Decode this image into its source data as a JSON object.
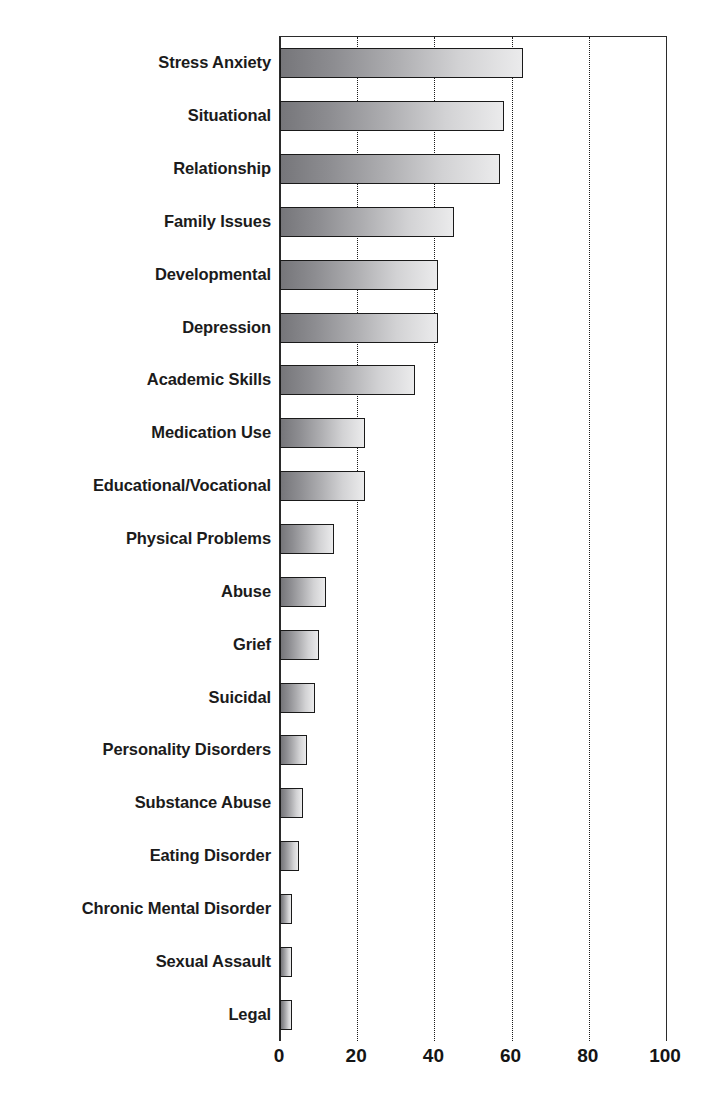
{
  "chart_data": {
    "type": "bar",
    "orientation": "horizontal",
    "title": "",
    "subtitle": "",
    "xlabel": "",
    "ylabel": "",
    "xlim": [
      0,
      100
    ],
    "xticks": [
      0,
      20,
      40,
      60,
      80,
      100
    ],
    "xtick_labels": [
      "0",
      "20",
      "40",
      "60",
      "80",
      "100"
    ],
    "grid": "vertical-dotted",
    "legend": "none",
    "categories": [
      "Stress Anxiety",
      "Situational",
      "Relationship",
      "Family Issues",
      "Developmental",
      "Depression",
      "Academic Skills",
      "Medication Use",
      "Educational/Vocational",
      "Physical Problems",
      "Abuse",
      "Grief",
      "Suicidal",
      "Personality Disorders",
      "Substance Abuse",
      "Eating Disorder",
      "Chronic Mental Disorder",
      "Sexual Assault",
      "Legal"
    ],
    "values": [
      63,
      58,
      57,
      45,
      41,
      41,
      35,
      22,
      22,
      14,
      12,
      10,
      9,
      7,
      6,
      5,
      3,
      3,
      3
    ],
    "bar_fill_start": "#76767a",
    "bar_fill_end": "#ebebec",
    "bar_border_color": "#1a1a1a",
    "bar_shadow_color": "#d6d6d6",
    "axis_color": "#2b2b2b",
    "label_color": "#1b1b1b",
    "background": "#ffffff"
  }
}
